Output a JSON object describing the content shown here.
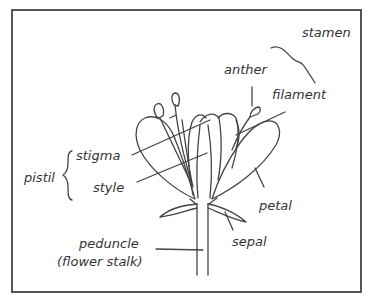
{
  "diagram": {
    "labels": {
      "stamen": "stamen",
      "anther": "anther",
      "filament": "filament",
      "pistil": "pistil",
      "stigma": "stigma",
      "style": "style",
      "petal": "petal",
      "sepal": "sepal",
      "peduncle": "peduncle",
      "peduncle_note": "(flower stalk)"
    },
    "colors": {
      "line": "#444444",
      "text": "#333333",
      "border": "#555555",
      "background": "#ffffff"
    }
  }
}
